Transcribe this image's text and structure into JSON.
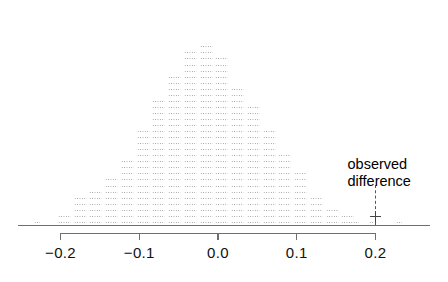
{
  "chart_data": {
    "type": "bar",
    "title": "",
    "subtitle": "",
    "xlabel": "",
    "ylabel": "",
    "xlim": [
      -0.26,
      0.26
    ],
    "ylim": [
      0,
      32
    ],
    "grid": false,
    "legend_position": "none",
    "style": "dotplot-histogram",
    "bin_width": 0.01,
    "categories": [
      "-0.23",
      "-0.21",
      "-0.195",
      "-0.185",
      "-0.175",
      "-0.165",
      "-0.155",
      "-0.145",
      "-0.135",
      "-0.125",
      "-0.115",
      "-0.105",
      "-0.095",
      "-0.085",
      "-0.075",
      "-0.065",
      "-0.055",
      "-0.045",
      "-0.035",
      "-0.025",
      "-0.015",
      "-0.005",
      "0.005",
      "0.015",
      "0.025",
      "0.035",
      "0.045",
      "0.055",
      "0.065",
      "0.075",
      "0.085",
      "0.095",
      "0.105",
      "0.115",
      "0.125",
      "0.135",
      "0.145",
      "0.155",
      "0.165",
      "0.175",
      "0.185",
      "0.195",
      "0.23"
    ],
    "values": [
      1,
      0,
      2,
      0,
      5,
      0,
      6,
      0,
      8,
      0,
      11,
      0,
      16,
      0,
      21,
      0,
      25,
      0,
      29,
      0,
      30,
      0,
      28,
      0,
      23,
      0,
      20,
      0,
      16,
      0,
      12,
      0,
      9,
      0,
      5,
      0,
      3,
      0,
      2,
      1,
      0,
      1,
      1
    ],
    "x_ticks": [
      -0.2,
      -0.1,
      0.0,
      0.1,
      0.2
    ],
    "x_tick_labels": [
      "-0.2",
      "-0.1",
      "0.0",
      "0.1",
      "0.2"
    ],
    "annotations": [
      {
        "name": "observed-difference",
        "text_line1": "observed",
        "text_line2": "difference",
        "x": 0.2,
        "marker": "cross",
        "line_style": "dashed"
      }
    ],
    "colors": {
      "dot": "#9a9a9a",
      "axis": "#6f6f6f",
      "annotation": "#000000",
      "marker": "#444444",
      "background": "#ffffff"
    }
  },
  "annotation": {
    "line1": "observed",
    "line2": "difference"
  },
  "axis": {
    "tick_labels": [
      "-0.2",
      "-0.1",
      "0.0",
      "0.1",
      "0.2"
    ]
  }
}
